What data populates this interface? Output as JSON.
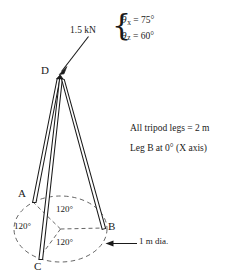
{
  "figure": {
    "nodes": {
      "a": "A",
      "b": "B",
      "c": "C",
      "d": "D"
    },
    "force": {
      "magnitude_label": "1.5 kN",
      "theta_x": {
        "symbol": "θ",
        "subscript": "x",
        "equals": "=",
        "value": "75°"
      },
      "theta_z": {
        "symbol": "θ",
        "subscript": "z",
        "equals": "=",
        "value": "60°"
      }
    },
    "notes": [
      "All tripod legs = 2 m",
      "Leg B at 0° (X axis)"
    ],
    "base_angles": [
      "120°",
      "120°",
      "120°"
    ],
    "diameter_label": "1 m dia.",
    "colors": {
      "ink": "#1a1a1a",
      "dashed": "#555555",
      "background": "#ffffff"
    }
  }
}
